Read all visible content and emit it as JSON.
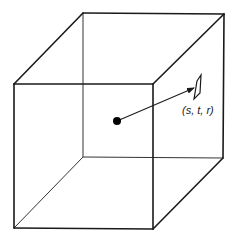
{
  "diagram": {
    "title": "",
    "cube": {
      "front_face": {
        "tl": [
          14,
          84
        ],
        "tr": [
          153,
          84
        ],
        "br": [
          153,
          229
        ],
        "bl": [
          14,
          228
        ]
      },
      "back_face": {
        "tl": [
          83,
          13
        ],
        "tr": [
          224,
          14
        ],
        "br": [
          223,
          158
        ],
        "bl": [
          83,
          157
        ]
      }
    },
    "center_point": [
      117,
      121
    ],
    "arrow_tip": [
      194,
      88
    ],
    "texel_quad": [
      [
        197,
        81
      ],
      [
        201,
        75
      ],
      [
        200,
        93
      ],
      [
        194,
        99
      ]
    ],
    "label": "(s, t, r)",
    "label_pos": [
      182,
      114
    ],
    "colors": {
      "line": "#1a1a1a",
      "background": "#ffffff"
    }
  }
}
